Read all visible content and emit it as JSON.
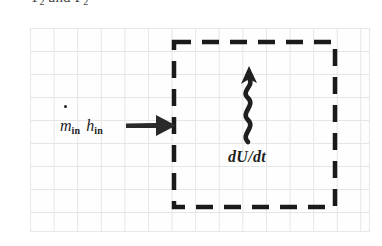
{
  "figure": {
    "name": "control-volume-energy-balance",
    "type": "thermodynamics-control-volume-diagram"
  },
  "caption": {
    "text": "T2 and P2",
    "base": "T",
    "sub1": "2",
    "conjunction": " and ",
    "base2": "P",
    "sub2": "2",
    "note": "clipped at top edge of image"
  },
  "grid": {
    "label": "graph-paper-grid",
    "cell_width_px": 23.6,
    "cell_height_px": 23.0,
    "columns": 14,
    "rows": 9,
    "line_color": "#d8d8d8",
    "background_color": "#fefefe"
  },
  "control_volume": {
    "label": "control-volume-boundary",
    "style": "dashed",
    "stroke_color": "#1a1a1a",
    "stroke_width_px": 4,
    "dash_pattern": "16 11",
    "width_px": 165,
    "height_px": 169
  },
  "inlet": {
    "arrow_name": "inlet-mass-flow-arrow",
    "arrow_direction": "right",
    "arrow_color": "#2a2a2a",
    "label_mass_flow_symbol": "m",
    "label_mass_flow_subscript": "in",
    "label_enthalpy_symbol": "h",
    "label_enthalpy_subscript": "in",
    "label_full": "ṁin hin",
    "has_dot_accent": true
  },
  "energy_storage": {
    "arrow_name": "squiggly-energy-arrow",
    "arrow_direction": "up",
    "arrow_color": "#1f1f1f",
    "arrow_style": "wavy",
    "label": "dU/dt",
    "label_meaning": "rate of change of internal energy"
  },
  "colors": {
    "ink": "#1a1a1a",
    "grid_line": "#d8d8d8",
    "paper": "#ffffff",
    "arrow": "#2a2a2a"
  }
}
